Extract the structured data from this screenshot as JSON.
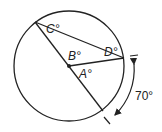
{
  "diagram": {
    "type": "circle-geometry",
    "labels": {
      "C": "C°",
      "B": "B°",
      "D": "D°",
      "A": "A°",
      "arc": "70°"
    },
    "colors": {
      "stroke": "#222222",
      "background": "#ffffff"
    }
  }
}
